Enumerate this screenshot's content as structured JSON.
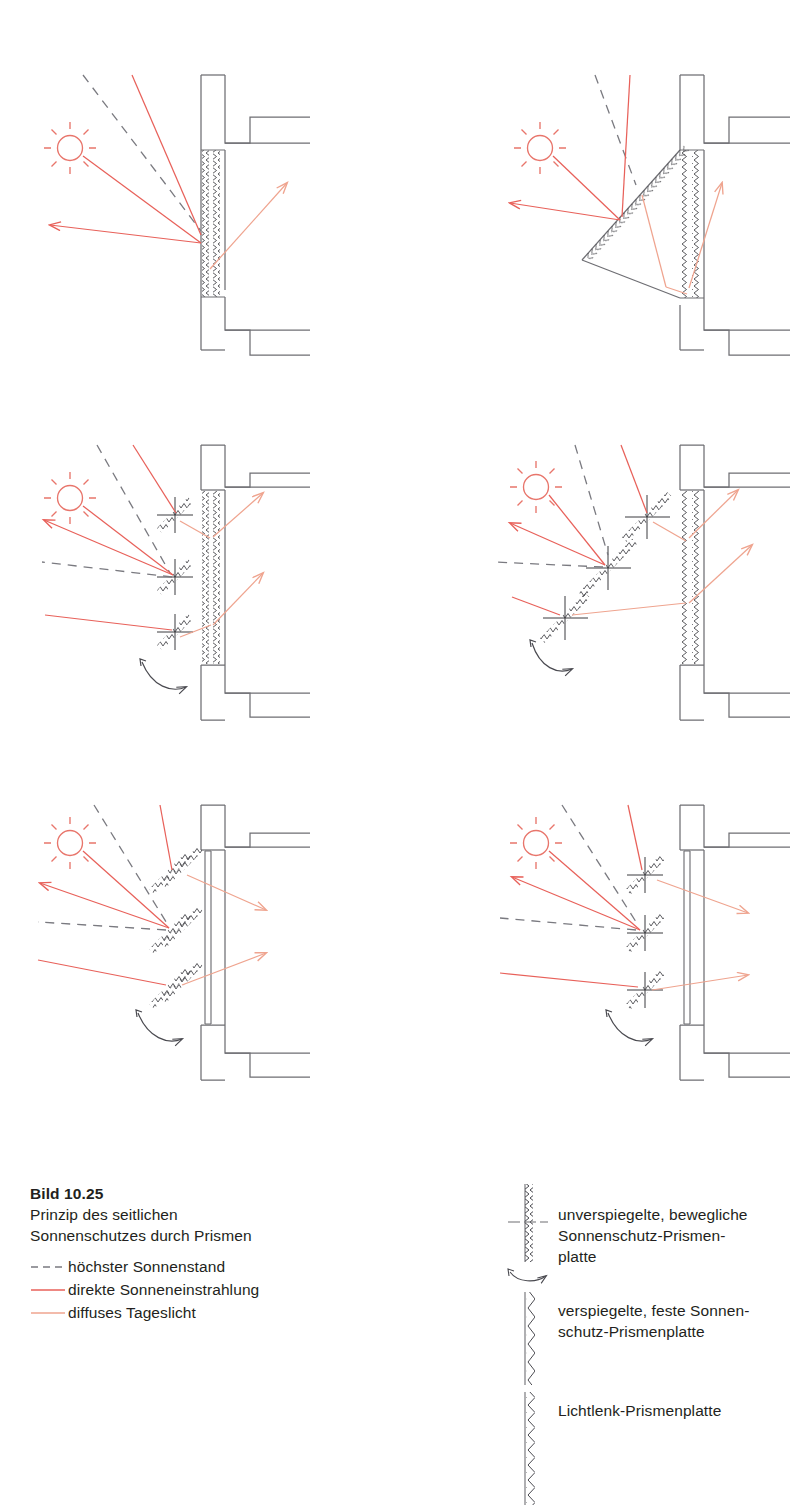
{
  "figure": {
    "number": "Bild 10.25",
    "caption_line_1": "Prinzip des seitlichen",
    "caption_line_2": "Sonnenschutzes durch Prismen"
  },
  "colors": {
    "direct_sun": "#E8615A",
    "diffuse_light": "#EFA48F",
    "construction_line": "#6E6E73",
    "sun_symbol": "#E8756B",
    "text": "#231f20",
    "background": "#ffffff"
  },
  "line_legend": {
    "items": [
      {
        "style": "dashed",
        "color": "#7A7A80",
        "label": "höchster Sonnenstand",
        "icon": "dashed-line-icon"
      },
      {
        "style": "solid",
        "color": "#E8615A",
        "label": "direkte Sonneneinstrahlung",
        "icon": "solid-line-icon"
      },
      {
        "style": "solid",
        "color": "#EFA48F",
        "label": "diffuses Tageslicht",
        "icon": "solid-line-icon"
      }
    ]
  },
  "symbol_legend": {
    "items": [
      {
        "icon": "movable-prism-panel-icon",
        "lines": [
          "unverspiegelte, bewegliche",
          "Sonnenschutz-Prismen-",
          "platte"
        ]
      },
      {
        "icon": "fixed-mirrored-prism-panel-icon",
        "lines": [
          "verspiegelte, feste Sonnen-",
          "schutz-Prismenplatte"
        ]
      },
      {
        "icon": "light-directing-prism-panel-icon",
        "lines": [
          "Lichtlenk-Prismenplatte"
        ]
      }
    ]
  },
  "diagrams": [
    {
      "id": "diagram-top-left",
      "name": "fixed-vertical-prism-facade",
      "position": {
        "x": 30,
        "y": 60
      },
      "facade": "vertical-zigzag-glazing",
      "sun": {
        "x": 70,
        "y": 148
      },
      "rays_direct": 3,
      "rays_diffuse": 1,
      "louvers": 0
    },
    {
      "id": "diagram-top-right",
      "name": "triangular-bay-prism-facade",
      "position": {
        "x": 500,
        "y": 60
      },
      "facade": "vertical-zigzag-glazing-with-triangular-bay",
      "sun": {
        "x": 540,
        "y": 148
      },
      "rays_direct": 3,
      "rays_diffuse": 2,
      "louvers": 0
    },
    {
      "id": "diagram-middle-left",
      "name": "movable-prism-louvers-vertical-facade",
      "position": {
        "x": 30,
        "y": 430
      },
      "facade": "vertical-zigzag-glazing",
      "sun": {
        "x": 70,
        "y": 478
      },
      "rays_direct": 3,
      "rays_diffuse": 2,
      "louvers": 3,
      "rotation_arrow": true
    },
    {
      "id": "diagram-middle-right",
      "name": "movable-prism-louvers-diagonal-array",
      "position": {
        "x": 500,
        "y": 430
      },
      "facade": "vertical-zigzag-glazing",
      "sun": {
        "x": 540,
        "y": 478
      },
      "rays_direct": 3,
      "rays_diffuse": 2,
      "louvers": 3,
      "rotation_arrow": true
    },
    {
      "id": "diagram-bottom-left",
      "name": "double-prism-louvers-plain-glazing",
      "position": {
        "x": 30,
        "y": 790
      },
      "facade": "plain-double-glazing",
      "sun": {
        "x": 70,
        "y": 838
      },
      "rays_direct": 3,
      "rays_diffuse": 2,
      "louvers": 3,
      "rotation_arrow": true
    },
    {
      "id": "diagram-bottom-right",
      "name": "single-prism-louvers-plain-glazing",
      "position": {
        "x": 500,
        "y": 790
      },
      "facade": "plain-double-glazing",
      "sun": {
        "x": 540,
        "y": 838
      },
      "rays_direct": 3,
      "rays_diffuse": 2,
      "louvers": 3,
      "rotation_arrow": true
    }
  ]
}
